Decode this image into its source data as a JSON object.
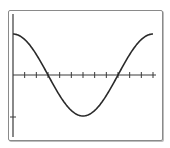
{
  "chart_data": {
    "type": "line",
    "title": "",
    "xlabel": "",
    "ylabel": "",
    "function": "y = cos(x)",
    "xlim": [
      0,
      6.2832
    ],
    "ylim": [
      -1.4,
      1.5
    ],
    "x_tick_step": 0.5236,
    "x_ticks_count": 12,
    "y_ticks": [
      -1
    ],
    "grid": false,
    "series": [
      {
        "name": "cos(x)",
        "x": [
          0,
          0.5236,
          1.0472,
          1.5708,
          2.0944,
          2.618,
          3.1416,
          3.6652,
          4.1888,
          4.7124,
          5.236,
          5.7596,
          6.2832
        ],
        "values": [
          1,
          0.866,
          0.5,
          0,
          -0.5,
          -0.866,
          -1,
          -0.866,
          -0.5,
          0,
          0.5,
          0.866,
          1
        ]
      }
    ]
  },
  "colors": {
    "curve": "#2a2a2a",
    "axes": "#3a3a3a",
    "frame": "#8a8a8a"
  }
}
